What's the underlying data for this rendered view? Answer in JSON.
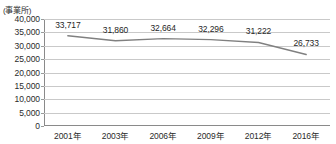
{
  "chart_data": {
    "type": "line",
    "title": "",
    "xlabel": "",
    "ylabel": "(事業所)",
    "y_unit_caption": "(事業所)",
    "categories": [
      "2001年",
      "2003年",
      "2006年",
      "2009年",
      "2012年",
      "2016年"
    ],
    "values": [
      33717,
      31860,
      32664,
      32296,
      31222,
      26733
    ],
    "data_labels": [
      "33,717",
      "31,860",
      "32,664",
      "32,296",
      "31,222",
      "26,733"
    ],
    "series": [
      {
        "name": "事業所数",
        "values": [
          33717,
          31860,
          32664,
          32296,
          31222,
          26733
        ],
        "color": "#808080"
      }
    ],
    "ylim": [
      0,
      40000
    ],
    "ytick_values": [
      0,
      5000,
      10000,
      15000,
      20000,
      25000,
      30000,
      35000,
      40000
    ],
    "ytick_labels": [
      "0",
      "5,000",
      "10,000",
      "15,000",
      "20,000",
      "25,000",
      "30,000",
      "35,000",
      "40,000"
    ],
    "grid": true,
    "grid_axis": "y",
    "legend": false,
    "legend_position": "none",
    "markers": false,
    "colors": {
      "line": "#808080",
      "grid": "#c9c9c9",
      "axis": "#8a8a8a",
      "text": "#2b2b2b",
      "background": "#ffffff"
    }
  }
}
